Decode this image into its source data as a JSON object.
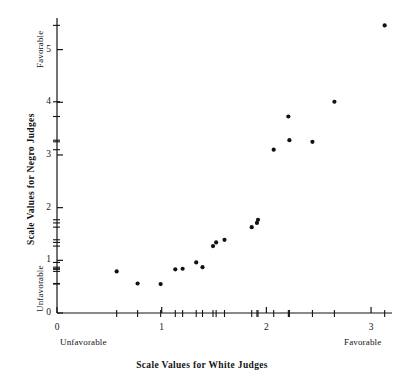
{
  "figure": {
    "title": "",
    "background_color": "#ffffff",
    "ink_color": "#141414",
    "width": 404,
    "height": 385
  },
  "axes": {
    "x": {
      "title": "Scale Values for White Judges",
      "low_end_label": "Unfavorable",
      "high_end_label": "Favorable",
      "tick_labels": [
        "0",
        "1",
        "2",
        "3"
      ],
      "tick_values": [
        0,
        1,
        2,
        3
      ],
      "range": [
        0,
        3.2
      ]
    },
    "y": {
      "title": "Scale Values for Negro Judges",
      "low_end_label": "Unfavorable",
      "high_end_label": "Favorable",
      "tick_labels": [
        "0",
        "1",
        "2",
        "3",
        "4",
        "5"
      ],
      "tick_values": [
        0,
        1,
        2,
        3,
        4,
        5
      ],
      "range": [
        0,
        5.6
      ]
    }
  },
  "chart_data": {
    "type": "scatter",
    "title": "",
    "xlabel": "Scale Values for White Judges",
    "ylabel": "Scale Values for Negro Judges",
    "xlim": [
      0,
      3.2
    ],
    "ylim": [
      0,
      5.6
    ],
    "xticks": [
      0,
      1,
      2,
      3
    ],
    "yticks": [
      0,
      1,
      2,
      3,
      4,
      5
    ],
    "grid": false,
    "legend": false,
    "marker": "filled-circle",
    "marker_color": "#111111",
    "marker_size_px": 4.2,
    "points": [
      {
        "x": 0.57,
        "y": 0.79
      },
      {
        "x": 0.77,
        "y": 0.56
      },
      {
        "x": 0.99,
        "y": 0.55
      },
      {
        "x": 1.13,
        "y": 0.83
      },
      {
        "x": 1.2,
        "y": 0.84
      },
      {
        "x": 1.33,
        "y": 0.96
      },
      {
        "x": 1.39,
        "y": 0.87
      },
      {
        "x": 1.49,
        "y": 1.27
      },
      {
        "x": 1.52,
        "y": 1.34
      },
      {
        "x": 1.6,
        "y": 1.39
      },
      {
        "x": 1.86,
        "y": 1.63
      },
      {
        "x": 1.91,
        "y": 1.71
      },
      {
        "x": 1.92,
        "y": 1.77
      },
      {
        "x": 2.07,
        "y": 3.1
      },
      {
        "x": 2.21,
        "y": 3.73
      },
      {
        "x": 2.22,
        "y": 3.28
      },
      {
        "x": 2.44,
        "y": 3.25
      },
      {
        "x": 2.65,
        "y": 4.01
      },
      {
        "x": 3.13,
        "y": 5.46
      }
    ],
    "x_rug_values": [
      0.57,
      0.77,
      0.99,
      1.13,
      1.2,
      1.33,
      1.39,
      1.49,
      1.52,
      1.6,
      1.86,
      1.91,
      1.92,
      2.07,
      2.21,
      2.22,
      2.44,
      2.65,
      3.13
    ],
    "y_rug_values": [
      0.55,
      0.56,
      0.79,
      0.83,
      0.84,
      0.87,
      0.96,
      1.27,
      1.34,
      1.39,
      1.63,
      1.71,
      1.77,
      3.1,
      3.25,
      3.28,
      3.73,
      4.01,
      5.46
    ]
  },
  "page_marker": {
    "text": "",
    "visible": false
  }
}
